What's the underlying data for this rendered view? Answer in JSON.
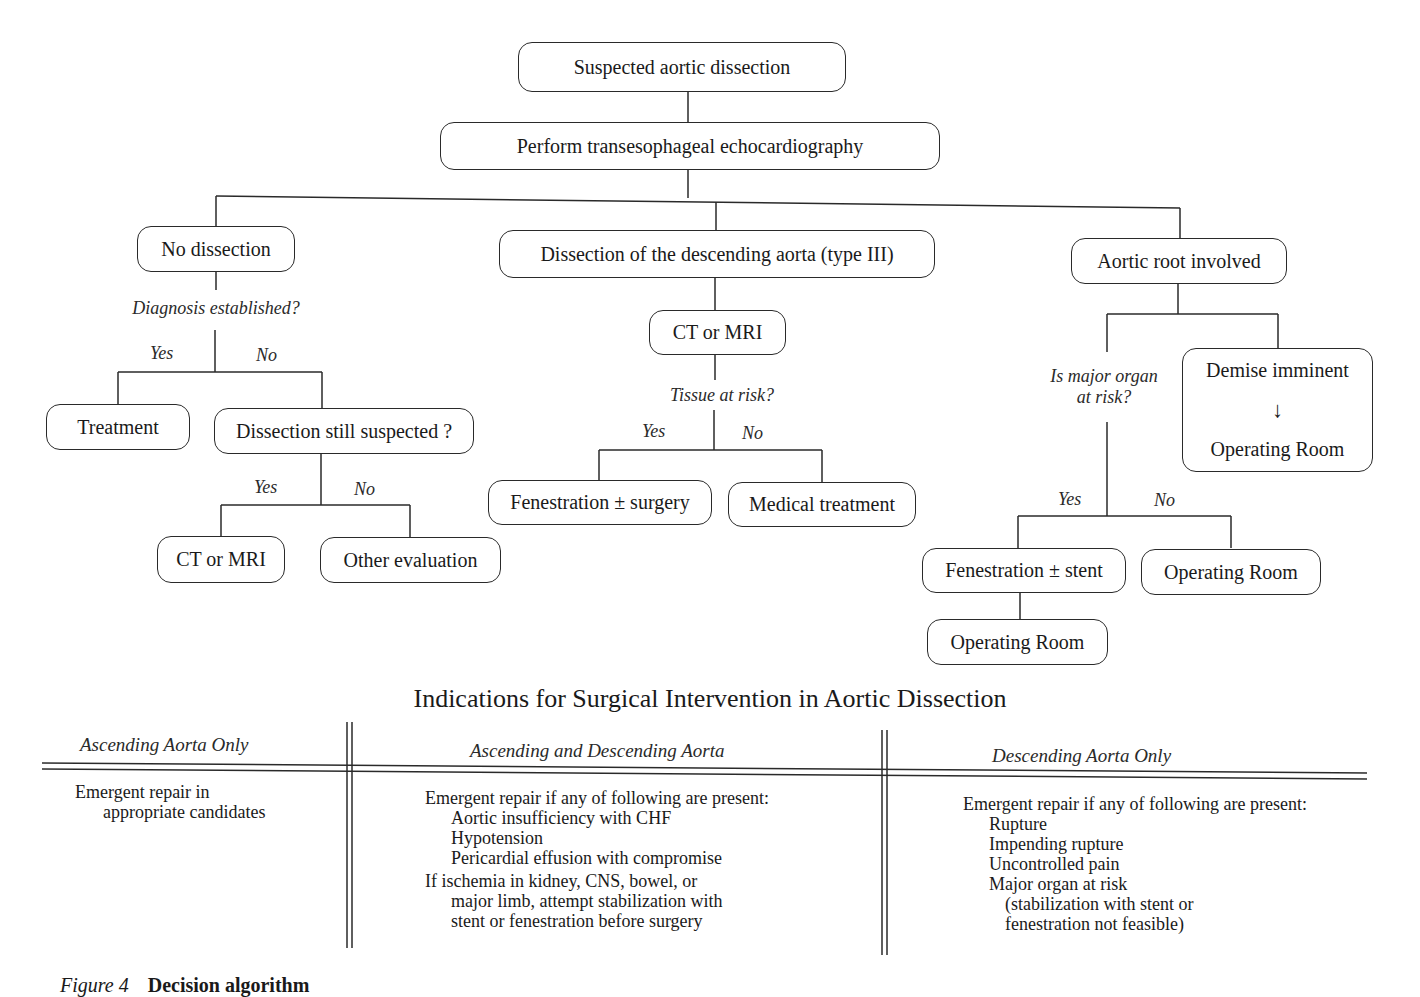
{
  "flowchart": {
    "root": "Suspected aortic dissection",
    "tee": "Perform transesophageal echocardiography",
    "branches": {
      "no_dissection": {
        "label": "No dissection",
        "question": "Diagnosis established?",
        "yes_label": "Yes",
        "no_label": "No",
        "yes_node": "Treatment",
        "no_node": "Dissection still suspected ?",
        "sub": {
          "yes_label": "Yes",
          "no_label": "No",
          "yes_node": "CT or MRI",
          "no_node": "Other evaluation"
        }
      },
      "descending": {
        "label": "Dissection of the descending aorta (type III)",
        "imaging": "CT or MRI",
        "question": "Tissue at risk?",
        "yes_label": "Yes",
        "no_label": "No",
        "yes_node": "Fenestration ± surgery",
        "no_node": "Medical treatment"
      },
      "aortic_root": {
        "label": "Aortic root involved",
        "question_line1": "Is major organ",
        "question_line2": "at risk?",
        "demise_title": "Demise imminent",
        "demise_arrow": "↓",
        "demise_result": "Operating Room",
        "yes_label": "Yes",
        "no_label": "No",
        "yes_node": "Fenestration ± stent",
        "yes_next": "Operating Room",
        "no_node": "Operating Room"
      }
    }
  },
  "table": {
    "title": "Indications for Surgical Intervention in Aortic Dissection",
    "columns": [
      {
        "header": "Ascending Aorta Only",
        "lines": [
          {
            "text": "Emergent repair in",
            "indent": 0
          },
          {
            "text": "appropriate candidates",
            "indent": 1
          }
        ]
      },
      {
        "header": "Ascending and Descending Aorta",
        "lines": [
          {
            "text": "Emergent repair if any of following are present:",
            "indent": 0
          },
          {
            "text": "Aortic insufficiency with CHF",
            "indent": 1
          },
          {
            "text": "Hypotension",
            "indent": 1
          },
          {
            "text": "Pericardial effusion with compromise",
            "indent": 1
          },
          {
            "text": "If ischemia in kidney, CNS, bowel, or",
            "indent": 0
          },
          {
            "text": "major limb, attempt stabilization with",
            "indent": 1
          },
          {
            "text": "stent or fenestration before surgery",
            "indent": 1
          }
        ]
      },
      {
        "header": "Descending Aorta Only",
        "lines": [
          {
            "text": "Emergent repair if any of following are present:",
            "indent": 0
          },
          {
            "text": "Rupture",
            "indent": 1
          },
          {
            "text": "Impending rupture",
            "indent": 1
          },
          {
            "text": "Uncontrolled pain",
            "indent": 1
          },
          {
            "text": "Major organ at risk",
            "indent": 1
          },
          {
            "text": "(stabilization with stent or",
            "indent": 2
          },
          {
            "text": "fenestration not feasible)",
            "indent": 2
          }
        ]
      }
    ]
  },
  "caption": {
    "figure_label": "Figure 4",
    "text": "Decision algorithm"
  }
}
